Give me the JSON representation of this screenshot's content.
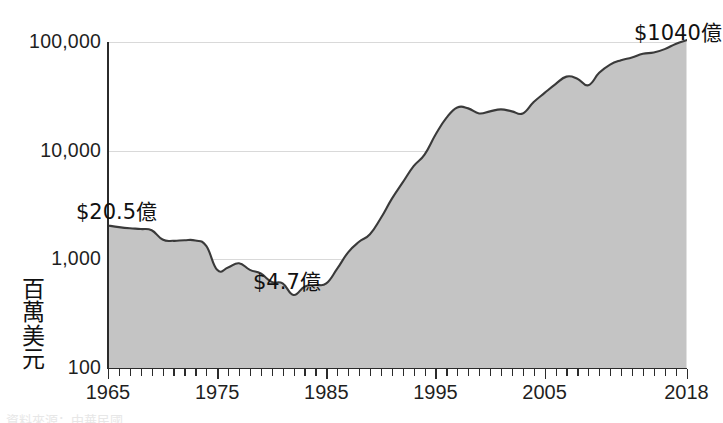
{
  "yaxis": {
    "title_chars": [
      "百",
      "萬",
      "美",
      "元"
    ],
    "title_text": "百萬美元",
    "ticks": [
      {
        "label": "100,000",
        "value": 100000
      },
      {
        "label": "10,000",
        "value": 10000
      },
      {
        "label": "1,000",
        "value": 1000
      },
      {
        "label": "100",
        "value": 100
      }
    ]
  },
  "xaxis": {
    "ticks": [
      {
        "label": "1965",
        "value": 1965
      },
      {
        "label": "1975",
        "value": 1975
      },
      {
        "label": "1985",
        "value": 1985
      },
      {
        "label": "1995",
        "value": 1995
      },
      {
        "label": "2005",
        "value": 2005
      },
      {
        "label": "2018",
        "value": 2018
      }
    ]
  },
  "annotations": [
    {
      "name": "start-value-annotation",
      "text": "$20.5億"
    },
    {
      "name": "low-value-annotation",
      "text": "$4.7億"
    },
    {
      "name": "end-value-annotation",
      "text": "$1040億"
    }
  ],
  "colors": {
    "area_fill": "#c4c4c4",
    "area_line": "#3a3a3a",
    "gridline": "#d9d9d9",
    "axis": "#2b2b2b",
    "text": "#1a1a1a"
  },
  "footer": {
    "text": "資料來源：中華民國"
  },
  "chart_data": {
    "type": "area",
    "title": "",
    "subtitle": "",
    "xlabel": "",
    "ylabel": "百萬美元",
    "xlim": [
      1965,
      2018
    ],
    "ylim": [
      100,
      100000
    ],
    "yscale": "log",
    "grid": true,
    "legend": "none",
    "annotations": [
      {
        "x": 1965,
        "y": 2050,
        "text": "$20.5億"
      },
      {
        "x": 1982,
        "y": 470,
        "text": "$4.7億"
      },
      {
        "x": 2018,
        "y": 104000,
        "text": "$1040億"
      }
    ],
    "x": [
      1965,
      1966,
      1967,
      1968,
      1969,
      1970,
      1971,
      1972,
      1973,
      1974,
      1975,
      1976,
      1977,
      1978,
      1979,
      1980,
      1981,
      1982,
      1983,
      1984,
      1985,
      1986,
      1987,
      1988,
      1989,
      1990,
      1991,
      1992,
      1993,
      1994,
      1995,
      1996,
      1997,
      1998,
      1999,
      2000,
      2001,
      2002,
      2003,
      2004,
      2005,
      2006,
      2007,
      2008,
      2009,
      2010,
      2011,
      2012,
      2013,
      2014,
      2015,
      2016,
      2017,
      2018
    ],
    "values": [
      2050,
      1980,
      1930,
      1900,
      1850,
      1520,
      1480,
      1500,
      1490,
      1330,
      800,
      840,
      920,
      800,
      740,
      620,
      600,
      470,
      560,
      580,
      600,
      820,
      1160,
      1450,
      1700,
      2400,
      3600,
      5100,
      7200,
      9200,
      14000,
      20000,
      25000,
      24500,
      22000,
      23000,
      24000,
      23000,
      22000,
      28000,
      34000,
      41000,
      48000,
      46000,
      40000,
      52000,
      62000,
      68000,
      72000,
      78000,
      80000,
      86000,
      96000,
      104000
    ],
    "series": [
      {
        "name": "外匯存底",
        "values": [
          2050,
          1980,
          1930,
          1900,
          1850,
          1520,
          1480,
          1500,
          1490,
          1330,
          800,
          840,
          920,
          800,
          740,
          620,
          600,
          470,
          560,
          580,
          600,
          820,
          1160,
          1450,
          1700,
          2400,
          3600,
          5100,
          7200,
          9200,
          14000,
          20000,
          25000,
          24500,
          22000,
          23000,
          24000,
          23000,
          22000,
          28000,
          34000,
          41000,
          48000,
          46000,
          40000,
          52000,
          62000,
          68000,
          72000,
          78000,
          80000,
          86000,
          96000,
          104000
        ]
      }
    ]
  }
}
